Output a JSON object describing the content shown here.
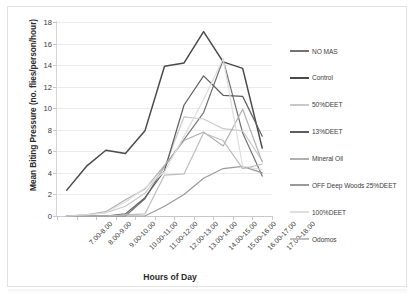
{
  "figure": {
    "background_color": "#ffffff",
    "frame_color": "#e2e2e6"
  },
  "axes": {
    "y_title": "Mean Biting Pressure (no. flies/person/hour)",
    "x_title": "Hours of Day",
    "y_ticks": [
      "0",
      "2",
      "4",
      "6",
      "8",
      "10",
      "12",
      "14",
      "16",
      "18"
    ],
    "x_ticks": [
      "7.00-8.00",
      "8.00-9.00",
      "9.00-10.00",
      "10.00-11.00",
      "11.00-12.00",
      "12.00-13.00",
      "13.00-14.00",
      "14.00-15.00",
      "15.00-16.00",
      "16.00-17.00",
      "17.00-18.00"
    ]
  },
  "legend": {
    "position": "right",
    "items": [
      {
        "label": "NO MAS",
        "color": "#737373"
      },
      {
        "label": "Control",
        "color": "#4a4a4a"
      },
      {
        "label": "50%DEET",
        "color": "#c9c9c9"
      },
      {
        "label": "13%DEET",
        "color": "#5e5e5e"
      },
      {
        "label": "Mineral Oil",
        "color": "#b0b0b0"
      },
      {
        "label": "OFF Deep Woods 25%DEET",
        "color": "#9a9a9a"
      },
      {
        "label": "100%DEET",
        "color": "#dedede"
      },
      {
        "label": "Odomos",
        "color": "#bdbdbd"
      }
    ]
  },
  "chart_data": {
    "type": "line",
    "title": "",
    "xlabel": "Hours of Day",
    "ylabel": "Mean Biting Pressure (no. flies/person/hour)",
    "ylim": [
      0,
      18
    ],
    "y_tick_step": 2,
    "grid": true,
    "legend_position": "right",
    "categories": [
      "7.00-8.00",
      "8.00-9.00",
      "9.00-10.00",
      "10.00-11.00",
      "11.00-12.00",
      "12.00-13.00",
      "13.00-14.00",
      "14.00-15.00",
      "15.00-16.00",
      "16.00-17.00",
      "17.00-18.00"
    ],
    "series": [
      {
        "name": "NO MAS",
        "color": "#737373",
        "values": [
          0,
          0,
          0,
          0,
          1.6,
          4.6,
          7.1,
          9.6,
          14.5,
          7.7,
          3.7
        ]
      },
      {
        "name": "Control",
        "color": "#4a4a4a",
        "values": [
          2.4,
          4.6,
          6.1,
          5.8,
          7.9,
          13.9,
          14.2,
          17.1,
          14.3,
          13.7,
          6.3
        ]
      },
      {
        "name": "50%DEET",
        "color": "#c9c9c9",
        "values": [
          0,
          0.1,
          0.3,
          0.9,
          2.1,
          4.5,
          9.2,
          9.0,
          8.1,
          7.9,
          5.1
        ]
      },
      {
        "name": "13%DEET",
        "color": "#5e5e5e",
        "values": [
          0,
          0,
          0,
          0.2,
          1.7,
          4.2,
          10.3,
          13.0,
          11.2,
          11.1,
          7.4
        ]
      },
      {
        "name": "Mineral Oil",
        "color": "#b0b0b0",
        "values": [
          0,
          0.1,
          0.4,
          1.5,
          2.5,
          4.7,
          7.0,
          7.8,
          6.5,
          9.9,
          5.0
        ]
      },
      {
        "name": "OFF Deep Woods 25%DEET",
        "color": "#9a9a9a",
        "values": [
          0,
          0,
          0,
          0,
          0,
          0.9,
          2.0,
          3.5,
          4.4,
          4.6,
          4.0
        ]
      },
      {
        "name": "100%DEET",
        "color": "#dedede",
        "values": [
          0,
          0.1,
          0.3,
          1.3,
          2.6,
          4.1,
          7.4,
          10.8,
          14.6,
          4.6,
          4.3
        ]
      },
      {
        "name": "Odomos",
        "color": "#bdbdbd",
        "values": [
          0,
          0,
          0,
          0.1,
          0.2,
          3.8,
          3.9,
          7.7,
          7.0,
          4.4,
          4.8
        ]
      }
    ]
  }
}
